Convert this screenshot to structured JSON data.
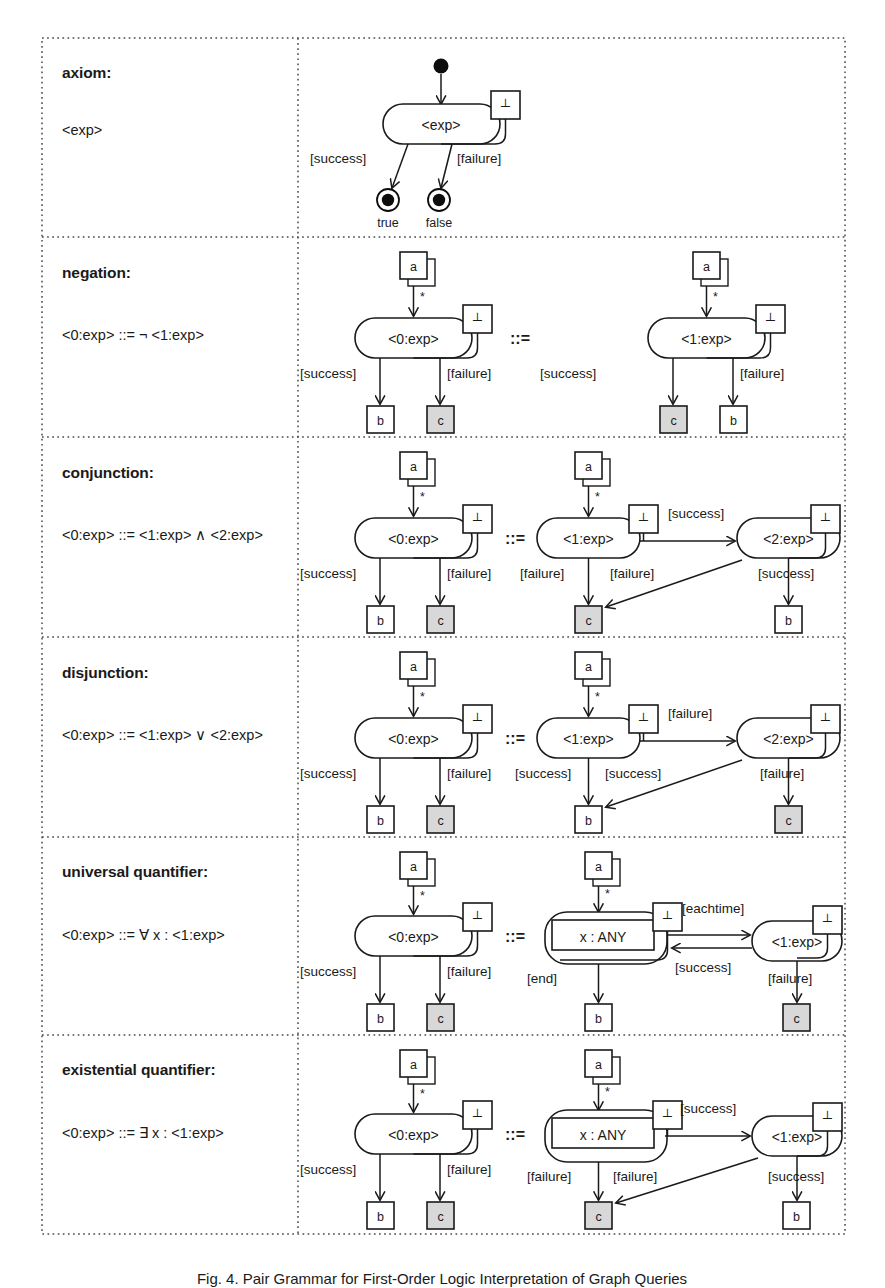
{
  "figure": {
    "caption": "Fig. 4. Pair Grammar for First-Order Logic Interpretation of Graph Queries",
    "symbols": {
      "stop_icon": "┴",
      "equivalence": "::=",
      "multiplicity": "*"
    },
    "colors": {
      "line": "#1a1a1a",
      "shaded_node_fill": "#d8d8d8",
      "plain_node_fill": "#ffffff",
      "grid": "#4a4a4a"
    }
  },
  "rows": [
    {
      "id": "axiom",
      "title": "axiom:",
      "production": "<exp>",
      "lhs": {
        "start_node": "initial-state",
        "activity": "<exp>",
        "stop_box": "┴",
        "guards": [
          "[success]",
          "[failure]"
        ],
        "end_nodes": [
          {
            "label": "true"
          },
          {
            "label": "false"
          }
        ]
      },
      "rhs": null
    },
    {
      "id": "negation",
      "title": "negation:",
      "production": "<0:exp> ::= ¬ <1:exp>",
      "lhs": {
        "source": "a",
        "mult": "*",
        "activity": "<0:exp>",
        "stop_box": "┴",
        "guards": [
          "[success]",
          "[failure]"
        ],
        "targets": [
          "b",
          "c"
        ],
        "shaded": [
          false,
          true
        ]
      },
      "rhs": {
        "source": "a",
        "mult": "*",
        "activity": "<1:exp>",
        "stop_box": "┴",
        "guards": [
          "[success]",
          "[failure]"
        ],
        "targets": [
          "c",
          "b"
        ],
        "shaded": [
          true,
          false
        ]
      }
    },
    {
      "id": "conjunction",
      "title": "conjunction:",
      "production": "<0:exp> ::=  <1:exp> ∧ <2:exp>",
      "lhs": {
        "source": "a",
        "mult": "*",
        "activity": "<0:exp>",
        "stop_box": "┴",
        "guards": [
          "[success]",
          "[failure]"
        ],
        "targets": [
          "b",
          "c"
        ],
        "shaded": [
          false,
          true
        ]
      },
      "rhs": {
        "source": "a",
        "mult": "*",
        "activity1": "<1:exp>",
        "activity2": "<2:exp>",
        "stop_box": "┴",
        "link_guard": "[success]",
        "guard_a1_down": "[failure]",
        "guard_a2_cross": "[failure]",
        "guard_a2_down": "[success]",
        "targets": [
          "c",
          "b"
        ],
        "shaded": [
          true,
          false
        ]
      }
    },
    {
      "id": "disjunction",
      "title": "disjunction:",
      "production": "<0:exp> ::=  <1:exp> ∨ <2:exp>",
      "lhs": {
        "source": "a",
        "mult": "*",
        "activity": "<0:exp>",
        "stop_box": "┴",
        "guards": [
          "[success]",
          "[failure]"
        ],
        "targets": [
          "b",
          "c"
        ],
        "shaded": [
          false,
          true
        ]
      },
      "rhs": {
        "source": "a",
        "mult": "*",
        "activity1": "<1:exp>",
        "activity2": "<2:exp>",
        "stop_box": "┴",
        "link_guard": "[failure]",
        "guard_a1_down": "[success]",
        "guard_a2_cross": "[success]",
        "guard_a2_down": "[failure]",
        "targets": [
          "b",
          "c"
        ],
        "shaded": [
          false,
          true
        ]
      }
    },
    {
      "id": "universal-quantifier",
      "title": "universal quantifier:",
      "production": "<0:exp> ::= ∀ x : <1:exp>",
      "lhs": {
        "source": "a",
        "mult": "*",
        "activity": "<0:exp>",
        "stop_box": "┴",
        "guards": [
          "[success]",
          "[failure]"
        ],
        "targets": [
          "b",
          "c"
        ],
        "shaded": [
          false,
          true
        ]
      },
      "rhs": {
        "source": "a",
        "mult": "*",
        "loop_node": "x : ANY",
        "activity2": "<1:exp>",
        "stop_box": "┴",
        "forward_guard": "[eachtime]",
        "back_guard": "[success]",
        "guard_loop_down": "[end]",
        "guard_a2_down": "[failure]",
        "targets": [
          "b",
          "c"
        ],
        "shaded": [
          false,
          true
        ]
      }
    },
    {
      "id": "existential-quantifier",
      "title": "existential quantifier:",
      "production": "<0:exp> ::= ∃ x : <1:exp>",
      "lhs": {
        "source": "a",
        "mult": "*",
        "activity": "<0:exp>",
        "stop_box": "┴",
        "guards": [
          "[success]",
          "[failure]"
        ],
        "targets": [
          "b",
          "c"
        ],
        "shaded": [
          false,
          true
        ]
      },
      "rhs": {
        "source": "a",
        "mult": "*",
        "loop_node": "x : ANY",
        "activity2": "<1:exp>",
        "stop_box": "┴",
        "forward_guard": "[success]",
        "guard_loop_down": "[failure]",
        "guard_cross": "[failure]",
        "guard_a2_down": "[success]",
        "targets": [
          "c",
          "b"
        ],
        "shaded": [
          true,
          false
        ]
      }
    }
  ]
}
